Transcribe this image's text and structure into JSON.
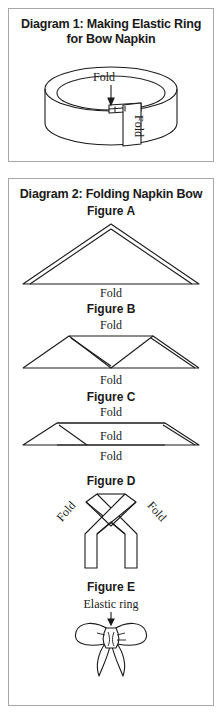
{
  "document": {
    "background_color": "#ffffff",
    "border_color": "#a8a8a8",
    "ink_color": "#1a1a1a"
  },
  "panel_one": {
    "title_line1": "Diagram 1: Making Elastic Ring",
    "title_line2": "for Bow Napkin",
    "labels": {
      "fold_top": "Fold",
      "fold_side": "Fold"
    }
  },
  "panel_two": {
    "title": "Diagram 2: Folding Napkin Bow",
    "figures": [
      {
        "name": "Figure A",
        "label": "Figure A",
        "shape": "triangle",
        "annotations": [
          {
            "text": "Fold",
            "position": "bottom"
          }
        ]
      },
      {
        "name": "Figure B",
        "label": "Figure B",
        "shape": "double-peak",
        "annotations": [
          {
            "text": "Fold",
            "position": "top"
          },
          {
            "text": "Fold",
            "position": "bottom"
          }
        ]
      },
      {
        "name": "Figure C",
        "label": "Figure C",
        "shape": "flattened-band",
        "annotations": [
          {
            "text": "Fold",
            "position": "top"
          },
          {
            "text": "Fold",
            "position": "middle"
          },
          {
            "text": "Fold",
            "position": "bottom"
          }
        ]
      },
      {
        "name": "Figure D",
        "label": "Figure D",
        "shape": "crossed-ribbon",
        "annotations": [
          {
            "text": "Fold",
            "position": "upper-left"
          },
          {
            "text": "Fold",
            "position": "upper-right"
          }
        ]
      },
      {
        "name": "Figure E",
        "label": "Figure E",
        "shape": "finished-bow",
        "annotations": [
          {
            "text": "Elastic ring",
            "position": "top"
          }
        ]
      }
    ]
  }
}
